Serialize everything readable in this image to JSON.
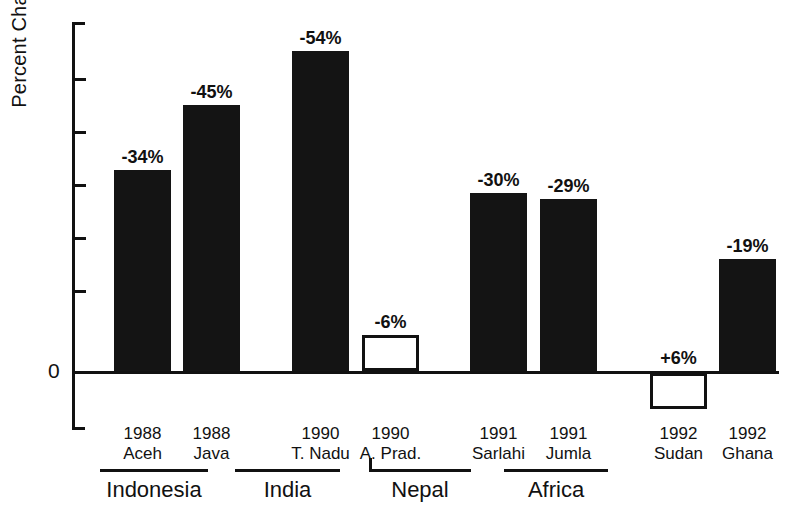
{
  "chart_data": {
    "type": "bar",
    "title": "",
    "xlabel": "",
    "ylabel": "Percent Change",
    "ylim": [
      -60,
      10
    ],
    "zero_label": "0",
    "grid": false,
    "legend": null,
    "orientation": "vertical",
    "note": "Bars drawn downward from the zero line; negative values extend upward in the printed figure (magnitude plotted above the axis), the single positive value is drawn below the axis.",
    "categories": [
      "1988 Aceh",
      "1988 Java",
      "1990 T. Nadu",
      "1990 A. Prad.",
      "1991 Sarlahi",
      "1991 Jumla",
      "1992 Sudan",
      "1992 Ghana"
    ],
    "values": [
      -34,
      -45,
      -54,
      -6,
      -30,
      -29,
      6,
      -19
    ],
    "data_labels": [
      "-34%",
      "-45%",
      "-54%",
      "-6%",
      "-30%",
      "-29%",
      "+6%",
      "-19%"
    ],
    "bars": [
      {
        "year": "1988",
        "place": "Aceh",
        "value": -34,
        "label": "-34%",
        "style": "filled",
        "group": "Indonesia"
      },
      {
        "year": "1988",
        "place": "Java",
        "value": -45,
        "label": "-45%",
        "style": "filled",
        "group": "Indonesia"
      },
      {
        "year": "1990",
        "place": "T. Nadu",
        "value": -54,
        "label": "-54%",
        "style": "filled",
        "group": "India"
      },
      {
        "year": "1990",
        "place": "A. Prad.",
        "value": -6,
        "label": "-6%",
        "style": "open",
        "group": "India"
      },
      {
        "year": "1991",
        "place": "Sarlahi",
        "value": -30,
        "label": "-30%",
        "style": "filled",
        "group": "Nepal"
      },
      {
        "year": "1991",
        "place": "Jumla",
        "value": -29,
        "label": "-29%",
        "style": "filled",
        "group": "Nepal"
      },
      {
        "year": "1992",
        "place": "Sudan",
        "value": 6,
        "label": "+6%",
        "style": "open",
        "group": "Africa"
      },
      {
        "year": "1992",
        "place": "Ghana",
        "value": -19,
        "label": "-19%",
        "style": "filled",
        "group": "Africa"
      }
    ],
    "groups": [
      {
        "name": "Indonesia"
      },
      {
        "name": "India"
      },
      {
        "name": "Nepal"
      },
      {
        "name": "Africa"
      }
    ],
    "colors": {
      "ink": "#111111",
      "bar_fill": "#141414",
      "bar_open_fill": "#ffffff",
      "background": "#ffffff"
    }
  }
}
